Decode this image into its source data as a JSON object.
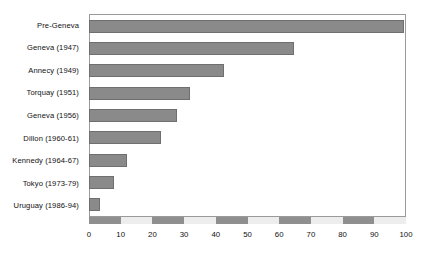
{
  "chart_data": {
    "type": "bar",
    "orientation": "horizontal",
    "title": "",
    "subtitle": "",
    "xlabel": "",
    "ylabel": "",
    "categories": [
      "Pre-Geneva",
      "Geneva (1947)",
      "Annecy (1949)",
      "Torquay (1951)",
      "Geneva (1956)",
      "Dillon (1960-61)",
      "Kennedy (1964-67)",
      "Tokyo (1973-79)",
      "Uruguay (1986-94)"
    ],
    "values": [
      100,
      65,
      43,
      32,
      28,
      23,
      12,
      8,
      3.5
    ],
    "xlim": [
      0,
      100
    ],
    "xticks": [
      0,
      10,
      20,
      30,
      40,
      50,
      60,
      70,
      80,
      90,
      100
    ],
    "xticklabels": [
      "0",
      "10",
      "20",
      "30",
      "40",
      "50",
      "60",
      "70",
      "80",
      "90",
      "100"
    ],
    "grid": false,
    "legend": null,
    "bar_color": "#8a8a8a",
    "bar_edge_color": "#6f6f6f",
    "frame_color": "#9a9a9a",
    "axis_band_dark": "#8f8f8f",
    "axis_band_light": "#ededed",
    "background": "#ffffff",
    "axis_band_segments": [
      "dark",
      "light",
      "dark",
      "light",
      "dark",
      "light",
      "dark",
      "light",
      "dark",
      "light"
    ]
  }
}
